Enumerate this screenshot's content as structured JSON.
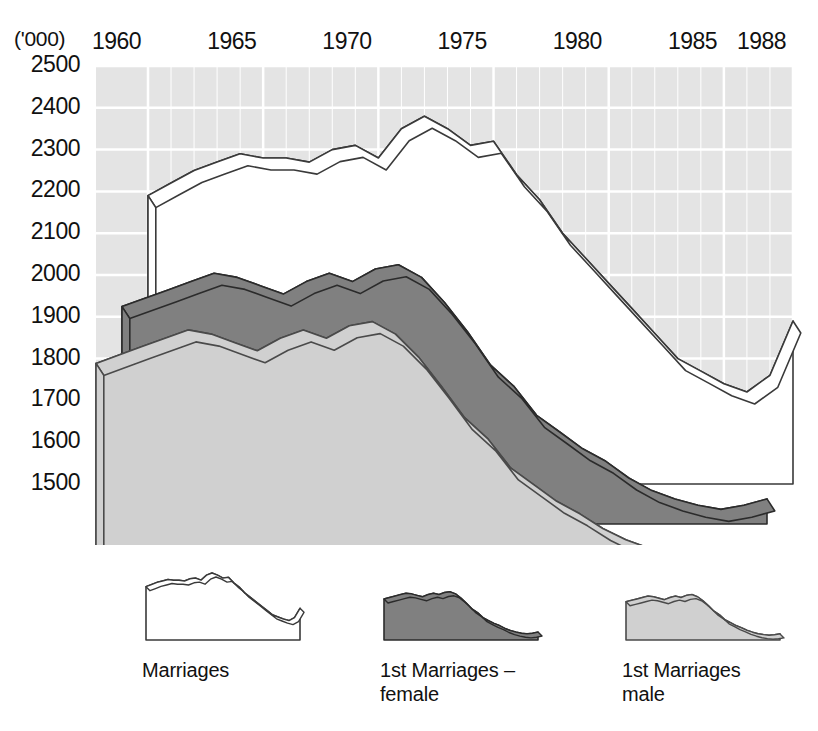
{
  "chart_data": {
    "type": "area",
    "title": "",
    "xlabel": "",
    "ylabel": "('000)",
    "unit_label": "('000)",
    "grid": true,
    "stacked": false,
    "three_d": true,
    "legend_position": "bottom",
    "xlim": [
      1960,
      1988
    ],
    "ylim": [
      1500,
      2500
    ],
    "ytick_step": 100,
    "yticks": [
      2500,
      2400,
      2300,
      2200,
      2100,
      2000,
      1900,
      1800,
      1700,
      1600,
      1500
    ],
    "xticks": [
      1960,
      1965,
      1970,
      1975,
      1980,
      1985,
      1988
    ],
    "x": [
      1960,
      1961,
      1962,
      1963,
      1964,
      1965,
      1966,
      1967,
      1968,
      1969,
      1970,
      1971,
      1972,
      1973,
      1974,
      1975,
      1976,
      1977,
      1978,
      1979,
      1980,
      1981,
      1982,
      1983,
      1984,
      1985,
      1986,
      1987,
      1988
    ],
    "series": [
      {
        "name": "Marriages",
        "color": "#ffffff",
        "line_color": "#3a3a3a",
        "values": [
          2190,
          2220,
          2250,
          2270,
          2290,
          2280,
          2280,
          2270,
          2300,
          2310,
          2280,
          2350,
          2380,
          2350,
          2310,
          2320,
          2240,
          2180,
          2100,
          2040,
          1980,
          1920,
          1860,
          1800,
          1770,
          1740,
          1720,
          1760,
          1890
        ]
      },
      {
        "name": "1st Marriages – female",
        "color": "#808080",
        "line_color": "#2b2b2b",
        "values": [
          2020,
          2040,
          2060,
          2080,
          2100,
          2090,
          2070,
          2050,
          2080,
          2100,
          2080,
          2110,
          2120,
          2090,
          2030,
          1960,
          1880,
          1830,
          1760,
          1720,
          1680,
          1650,
          1610,
          1580,
          1560,
          1545,
          1535,
          1545,
          1560
        ]
      },
      {
        "name": "1st Marriages male",
        "color": "#d0d0d0",
        "line_color": "#4a4a4a",
        "values": [
          1980,
          2000,
          2020,
          2040,
          2060,
          2050,
          2030,
          2010,
          2040,
          2060,
          2040,
          2070,
          2080,
          2050,
          1995,
          1925,
          1850,
          1800,
          1730,
          1690,
          1650,
          1620,
          1585,
          1558,
          1538,
          1525,
          1515,
          1522,
          1535
        ]
      }
    ]
  },
  "axes": {
    "unit": "('000)",
    "y_tick_labels": [
      "2500",
      "2400",
      "2300",
      "2200",
      "2100",
      "2000",
      "1900",
      "1800",
      "1700",
      "1600",
      "1500"
    ],
    "x_tick_labels": [
      "1960",
      "1965",
      "1970",
      "1975",
      "1980",
      "1985",
      "1988"
    ]
  },
  "legend": {
    "items": [
      {
        "label": "Marriages",
        "swatch": "white-area-thumbnail",
        "fill": "#ffffff"
      },
      {
        "label": "1st Marriages –\nfemale",
        "swatch": "dark-gray-area-thumbnail",
        "fill": "#808080"
      },
      {
        "label": "1st Marriages\nmale",
        "swatch": "light-gray-area-thumbnail",
        "fill": "#d0d0d0"
      }
    ]
  },
  "colors": {
    "plot_background": "#e4e4e4",
    "gridline": "#ffffff",
    "marriages_fill": "#ffffff",
    "first_marriages_female_fill": "#808080",
    "first_marriages_male_fill": "#d0d0d0",
    "outline": "#333333"
  }
}
